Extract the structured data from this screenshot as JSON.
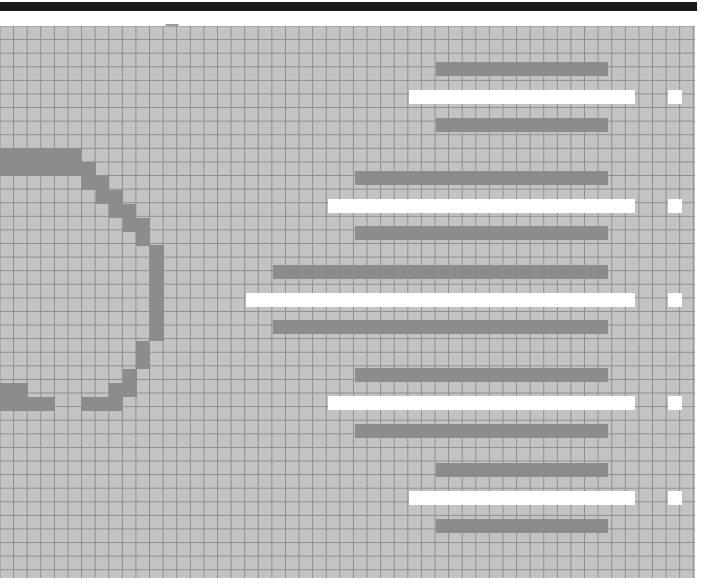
{
  "window": {
    "title": "Pixel Grid Canvas",
    "title_bar_color": "#1b1b1b"
  },
  "ruler": {
    "marker_name": "position-marker",
    "marker_x": 172,
    "marker_color": "#9a9a9a"
  },
  "canvas": {
    "width": 695,
    "height": 552,
    "background_color": "#c3c3c3",
    "grid_line_color": "#8e8e8e",
    "grid_cell_size": 13.6,
    "ink_color": "#8c8c8c",
    "highlight_color": "#ffffff"
  },
  "shapes": {
    "arc": {
      "name": "pixelated-circle-arc",
      "cells": [
        {
          "x": 0,
          "y": 148,
          "w": 82,
          "h": 14
        },
        {
          "x": 0,
          "y": 162,
          "w": 96,
          "h": 14
        },
        {
          "x": 82,
          "y": 176,
          "w": 27,
          "h": 14
        },
        {
          "x": 96,
          "y": 190,
          "w": 27,
          "h": 14
        },
        {
          "x": 109,
          "y": 204,
          "w": 27,
          "h": 14
        },
        {
          "x": 123,
          "y": 218,
          "w": 14,
          "h": 14
        },
        {
          "x": 136,
          "y": 218,
          "w": 14,
          "h": 28
        },
        {
          "x": 150,
          "y": 245,
          "w": 14,
          "h": 55
        },
        {
          "x": 150,
          "y": 300,
          "w": 14,
          "h": 41
        },
        {
          "x": 136,
          "y": 341,
          "w": 14,
          "h": 28
        },
        {
          "x": 123,
          "y": 369,
          "w": 14,
          "h": 14
        },
        {
          "x": 109,
          "y": 383,
          "w": 28,
          "h": 14
        },
        {
          "x": 82,
          "y": 397,
          "w": 41,
          "h": 14
        },
        {
          "x": 0,
          "y": 397,
          "w": 55,
          "h": 14
        },
        {
          "x": 0,
          "y": 383,
          "w": 28,
          "h": 14
        }
      ]
    },
    "bar_groups": [
      {
        "name": "bar-group-1",
        "rows": [
          {
            "kind": "dark",
            "x": 436,
            "y": 62,
            "w": 172,
            "h": 14
          },
          {
            "kind": "light",
            "x": 409,
            "y": 90,
            "w": 226,
            "h": 14
          },
          {
            "kind": "dark",
            "x": 436,
            "y": 118,
            "w": 172,
            "h": 14
          }
        ],
        "marker": {
          "x": 668,
          "y": 90,
          "w": 14,
          "h": 14
        }
      },
      {
        "name": "bar-group-2",
        "rows": [
          {
            "kind": "dark",
            "x": 355,
            "y": 171,
            "w": 253,
            "h": 14
          },
          {
            "kind": "light",
            "x": 328,
            "y": 199,
            "w": 307,
            "h": 14
          },
          {
            "kind": "dark",
            "x": 355,
            "y": 226,
            "w": 253,
            "h": 14
          }
        ],
        "marker": {
          "x": 668,
          "y": 199,
          "w": 14,
          "h": 14
        }
      },
      {
        "name": "bar-group-3",
        "rows": [
          {
            "kind": "dark",
            "x": 273,
            "y": 265,
            "w": 335,
            "h": 14
          },
          {
            "kind": "light",
            "x": 246,
            "y": 293,
            "w": 389,
            "h": 14
          },
          {
            "kind": "dark",
            "x": 273,
            "y": 320,
            "w": 335,
            "h": 14
          }
        ],
        "marker": {
          "x": 668,
          "y": 293,
          "w": 14,
          "h": 14
        }
      },
      {
        "name": "bar-group-4",
        "rows": [
          {
            "kind": "dark",
            "x": 355,
            "y": 368,
            "w": 253,
            "h": 14
          },
          {
            "kind": "light",
            "x": 328,
            "y": 396,
            "w": 307,
            "h": 14
          },
          {
            "kind": "dark",
            "x": 355,
            "y": 424,
            "w": 253,
            "h": 14
          }
        ],
        "marker": {
          "x": 668,
          "y": 396,
          "w": 14,
          "h": 14
        }
      },
      {
        "name": "bar-group-5",
        "rows": [
          {
            "kind": "dark",
            "x": 436,
            "y": 463,
            "w": 172,
            "h": 14
          },
          {
            "kind": "light",
            "x": 409,
            "y": 491,
            "w": 226,
            "h": 14
          },
          {
            "kind": "dark",
            "x": 436,
            "y": 519,
            "w": 172,
            "h": 14
          }
        ],
        "marker": {
          "x": 668,
          "y": 491,
          "w": 14,
          "h": 14
        }
      }
    ]
  }
}
